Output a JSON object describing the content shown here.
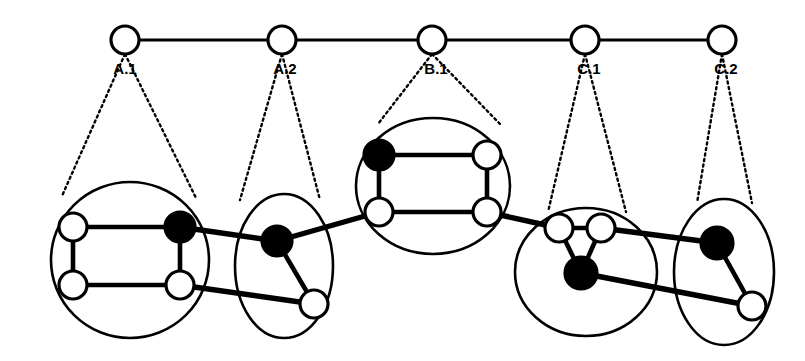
{
  "diagram": {
    "colors": {
      "stroke": "#000000",
      "node_fill_white": "#ffffff",
      "node_fill_black": "#000000",
      "background": "#ffffff"
    },
    "abstract_level": {
      "nodes": [
        {
          "id": "A.1",
          "label": "A.1",
          "cx": 125,
          "cy": 40,
          "r": 14,
          "fill": "white",
          "label_x": 125,
          "label_y": 70
        },
        {
          "id": "A.2",
          "label": "A.2",
          "cx": 282,
          "cy": 40,
          "r": 14,
          "fill": "white",
          "label_x": 285,
          "label_y": 70
        },
        {
          "id": "B.1",
          "label": "B.1",
          "cx": 432,
          "cy": 40,
          "r": 14,
          "fill": "white",
          "label_x": 436,
          "label_y": 70
        },
        {
          "id": "C.1",
          "label": "C.1",
          "cx": 585,
          "cy": 40,
          "r": 14,
          "fill": "white",
          "label_x": 589,
          "label_y": 70
        },
        {
          "id": "C.2",
          "label": "C.2",
          "cx": 722,
          "cy": 40,
          "r": 14,
          "fill": "white",
          "label_x": 726,
          "label_y": 70
        }
      ],
      "edges": [
        {
          "from": "A.1",
          "to": "A.2"
        },
        {
          "from": "A.2",
          "to": "B.1"
        },
        {
          "from": "B.1",
          "to": "C.1"
        },
        {
          "from": "C.1",
          "to": "C.2"
        }
      ]
    },
    "clusters": [
      {
        "id": "A.1",
        "label": "A.1",
        "shape": "ellipse",
        "cx": 130,
        "cy": 260,
        "rx": 79,
        "ry": 78,
        "leader_from": {
          "x": 125,
          "y": 54
        },
        "leader_to": [
          {
            "x": 62,
            "y": 196
          },
          {
            "x": 196,
            "y": 198
          }
        ],
        "nodes": [
          {
            "id": "a1-tl",
            "cx": 73,
            "cy": 227,
            "r": 14,
            "fill": "white"
          },
          {
            "id": "a1-tr",
            "cx": 180,
            "cy": 227,
            "r": 15,
            "fill": "black"
          },
          {
            "id": "a1-bl",
            "cx": 73,
            "cy": 285,
            "r": 14,
            "fill": "white"
          },
          {
            "id": "a1-br",
            "cx": 180,
            "cy": 285,
            "r": 14,
            "fill": "white"
          }
        ],
        "edges": [
          {
            "from": "a1-tl",
            "to": "a1-tr"
          },
          {
            "from": "a1-tl",
            "to": "a1-bl"
          },
          {
            "from": "a1-bl",
            "to": "a1-br"
          },
          {
            "from": "a1-tr",
            "to": "a1-br"
          }
        ]
      },
      {
        "id": "A.2",
        "label": "A.2",
        "shape": "ellipse",
        "cx": 284,
        "cy": 266,
        "rx": 49,
        "ry": 72,
        "leader_from": {
          "x": 282,
          "y": 54
        },
        "leader_to": [
          {
            "x": 240,
            "y": 200
          },
          {
            "x": 320,
            "y": 200
          }
        ],
        "nodes": [
          {
            "id": "a2-top",
            "cx": 277,
            "cy": 241,
            "r": 15,
            "fill": "black"
          },
          {
            "id": "a2-bot",
            "cx": 314,
            "cy": 304,
            "r": 14,
            "fill": "white"
          }
        ],
        "edges": [
          {
            "from": "a2-top",
            "to": "a2-bot"
          }
        ]
      },
      {
        "id": "B.1",
        "label": "B.1",
        "shape": "ellipse",
        "cx": 433,
        "cy": 186,
        "rx": 77,
        "ry": 68,
        "leader_from": {
          "x": 432,
          "y": 54
        },
        "leader_to": [
          {
            "x": 378,
            "y": 124
          },
          {
            "x": 500,
            "y": 124
          }
        ],
        "nodes": [
          {
            "id": "b1-tl",
            "cx": 379,
            "cy": 155,
            "r": 15,
            "fill": "black"
          },
          {
            "id": "b1-tr",
            "cx": 487,
            "cy": 155,
            "r": 14,
            "fill": "white"
          },
          {
            "id": "b1-bl",
            "cx": 379,
            "cy": 212,
            "r": 14,
            "fill": "white"
          },
          {
            "id": "b1-br",
            "cx": 487,
            "cy": 212,
            "r": 14,
            "fill": "white"
          }
        ],
        "edges": [
          {
            "from": "b1-tl",
            "to": "b1-tr"
          },
          {
            "from": "b1-tl",
            "to": "b1-bl"
          },
          {
            "from": "b1-bl",
            "to": "b1-br"
          },
          {
            "from": "b1-tr",
            "to": "b1-br"
          }
        ]
      },
      {
        "id": "C.1",
        "label": "C.1",
        "shape": "ellipse",
        "cx": 586,
        "cy": 272,
        "rx": 71,
        "ry": 64,
        "leader_from": {
          "x": 585,
          "y": 54
        },
        "leader_to": [
          {
            "x": 548,
            "y": 212
          },
          {
            "x": 626,
            "y": 212
          }
        ],
        "nodes": [
          {
            "id": "c1-tl",
            "cx": 559,
            "cy": 228,
            "r": 14,
            "fill": "white"
          },
          {
            "id": "c1-tr",
            "cx": 601,
            "cy": 228,
            "r": 14,
            "fill": "white"
          },
          {
            "id": "c1-bot",
            "cx": 581,
            "cy": 273,
            "r": 16,
            "fill": "black"
          }
        ],
        "edges": [
          {
            "from": "c1-tl",
            "to": "c1-tr"
          },
          {
            "from": "c1-tl",
            "to": "c1-bot"
          },
          {
            "from": "c1-tr",
            "to": "c1-bot"
          }
        ]
      },
      {
        "id": "C.2",
        "label": "C.2",
        "shape": "ellipse",
        "cx": 724,
        "cy": 272,
        "rx": 50,
        "ry": 73,
        "leader_from": {
          "x": 722,
          "y": 54
        },
        "leader_to": [
          {
            "x": 697,
            "y": 203
          },
          {
            "x": 752,
            "y": 203
          }
        ],
        "nodes": [
          {
            "id": "c2-top",
            "cx": 717,
            "cy": 243,
            "r": 16,
            "fill": "black"
          },
          {
            "id": "c2-bot",
            "cx": 752,
            "cy": 306,
            "r": 14,
            "fill": "white"
          }
        ],
        "edges": [
          {
            "from": "c2-top",
            "to": "c2-bot"
          }
        ]
      }
    ],
    "inter_cluster_edges": [
      {
        "from": "a1-tr",
        "to": "a2-top",
        "from_cluster": "A.1",
        "to_cluster": "A.2"
      },
      {
        "from": "a1-br",
        "to": "a2-bot",
        "from_cluster": "A.1",
        "to_cluster": "A.2"
      },
      {
        "from": "a2-top",
        "to": "b1-bl",
        "from_cluster": "A.2",
        "to_cluster": "B.1"
      },
      {
        "from": "b1-br",
        "to": "c1-tl",
        "from_cluster": "B.1",
        "to_cluster": "C.1"
      },
      {
        "from": "c1-tr",
        "to": "c2-top",
        "from_cluster": "C.1",
        "to_cluster": "C.2"
      },
      {
        "from": "c1-bot",
        "to": "c2-bot",
        "from_cluster": "C.1",
        "to_cluster": "C.2"
      }
    ]
  }
}
